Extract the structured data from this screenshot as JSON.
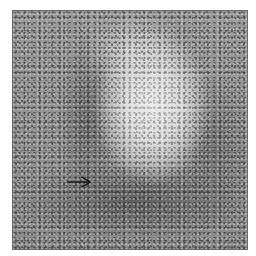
{
  "figure": {
    "type": "grayscale histology micrograph",
    "annotation": {
      "type": "arrow",
      "direction": "right",
      "points_to": "dense band of cells at lower-left border of pale region"
    },
    "colors": {
      "pale_region": "#e0e0e0",
      "dense_region": "#5e5e5e",
      "arrow": "#111111"
    }
  }
}
